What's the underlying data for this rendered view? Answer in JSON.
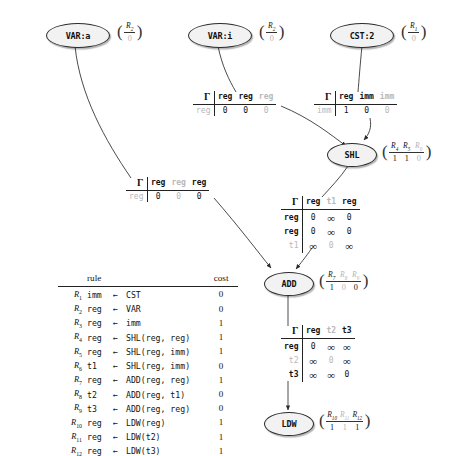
{
  "figure": {
    "type": "instruction-selection-dag",
    "nodes": [
      {
        "id": "var-a",
        "label": "VAR:a",
        "rvec": {
          "num": [
            "R2"
          ],
          "den": [
            "0"
          ],
          "dim": []
        }
      },
      {
        "id": "var-i",
        "label": "VAR:i",
        "rvec": {
          "num": [
            "R2"
          ],
          "den": [
            "0"
          ],
          "dim": []
        }
      },
      {
        "id": "cst-2",
        "label": "CST:2",
        "rvec": {
          "num": [
            "R1"
          ],
          "den": [
            "0"
          ],
          "dim": []
        }
      },
      {
        "id": "shl",
        "label": "SHL",
        "rvec": {
          "num": [
            "R4",
            "R5",
            "R6"
          ],
          "den": [
            "1",
            "1",
            "0"
          ],
          "dim": [
            2
          ]
        }
      },
      {
        "id": "add",
        "label": "ADD",
        "rvec": {
          "num": [
            "R7",
            "R8",
            "R9"
          ],
          "den": [
            "1",
            "0",
            "0"
          ],
          "dim": [
            1,
            2
          ]
        }
      },
      {
        "id": "ldw",
        "label": "LDW",
        "rvec": {
          "num": [
            "R10",
            "R11",
            "R12"
          ],
          "den": [
            "1",
            "1",
            "1"
          ],
          "dim": [
            1
          ]
        }
      }
    ],
    "tables": [
      {
        "id": "gamma-var-i",
        "corner": "Γ",
        "columns": [
          {
            "label": "reg",
            "dim": false
          },
          {
            "label": "reg",
            "dim": false
          },
          {
            "label": "reg",
            "dim": true
          }
        ],
        "rows": [
          {
            "label": "reg",
            "dim": true,
            "cells": [
              {
                "v": "0",
                "dim": false
              },
              {
                "v": "0",
                "dim": false
              },
              {
                "v": "0",
                "dim": true
              }
            ]
          }
        ]
      },
      {
        "id": "gamma-cst-2",
        "corner": "Γ",
        "columns": [
          {
            "label": "reg",
            "dim": false
          },
          {
            "label": "imm",
            "dim": false
          },
          {
            "label": "imm",
            "dim": true
          }
        ],
        "rows": [
          {
            "label": "imm",
            "dim": true,
            "cells": [
              {
                "v": "1",
                "dim": false
              },
              {
                "v": "0",
                "dim": false
              },
              {
                "v": "0",
                "dim": true
              }
            ]
          }
        ]
      },
      {
        "id": "gamma-var-a",
        "corner": "Γ",
        "columns": [
          {
            "label": "reg",
            "dim": false
          },
          {
            "label": "reg",
            "dim": true
          },
          {
            "label": "reg",
            "dim": false
          }
        ],
        "rows": [
          {
            "label": "reg",
            "dim": true,
            "cells": [
              {
                "v": "0",
                "dim": false
              },
              {
                "v": "0",
                "dim": true
              },
              {
                "v": "0",
                "dim": false
              }
            ]
          }
        ]
      },
      {
        "id": "gamma-shl",
        "corner": "Γ",
        "columns": [
          {
            "label": "reg",
            "dim": false
          },
          {
            "label": "t1",
            "dim": true
          },
          {
            "label": "reg",
            "dim": false
          }
        ],
        "rows": [
          {
            "label": "reg",
            "dim": false,
            "cells": [
              {
                "v": "0",
                "dim": false
              },
              {
                "v": "∞",
                "dim": false
              },
              {
                "v": "0",
                "dim": false
              }
            ]
          },
          {
            "label": "reg",
            "dim": false,
            "cells": [
              {
                "v": "0",
                "dim": false
              },
              {
                "v": "∞",
                "dim": false
              },
              {
                "v": "0",
                "dim": false
              }
            ]
          },
          {
            "label": "t1",
            "dim": true,
            "cells": [
              {
                "v": "∞",
                "dim": false
              },
              {
                "v": "0",
                "dim": true
              },
              {
                "v": "∞",
                "dim": false
              }
            ]
          }
        ]
      },
      {
        "id": "gamma-add",
        "corner": "Γ",
        "columns": [
          {
            "label": "reg",
            "dim": false
          },
          {
            "label": "t2",
            "dim": true
          },
          {
            "label": "t3",
            "dim": false
          }
        ],
        "rows": [
          {
            "label": "reg",
            "dim": false,
            "cells": [
              {
                "v": "0",
                "dim": false
              },
              {
                "v": "∞",
                "dim": false
              },
              {
                "v": "∞",
                "dim": false
              }
            ]
          },
          {
            "label": "t2",
            "dim": true,
            "cells": [
              {
                "v": "∞",
                "dim": false
              },
              {
                "v": "0",
                "dim": true
              },
              {
                "v": "∞",
                "dim": false
              }
            ]
          },
          {
            "label": "t3",
            "dim": false,
            "cells": [
              {
                "v": "∞",
                "dim": false
              },
              {
                "v": "∞",
                "dim": false
              },
              {
                "v": "0",
                "dim": false
              }
            ]
          }
        ]
      }
    ],
    "rules_table": {
      "header": {
        "rule": "rule",
        "cost": "cost"
      },
      "rows": [
        {
          "label": "R1",
          "lhs": "imm",
          "arrow": "←",
          "rhs": "CST",
          "cost": "0"
        },
        {
          "label": "R2",
          "lhs": "reg",
          "arrow": "←",
          "rhs": "VAR",
          "cost": "0"
        },
        {
          "label": "R3",
          "lhs": "reg",
          "arrow": "←",
          "rhs": "imm",
          "cost": "1"
        },
        {
          "label": "R4",
          "lhs": "reg",
          "arrow": "←",
          "rhs": "SHL(reg, reg)",
          "cost": "1"
        },
        {
          "label": "R5",
          "lhs": "reg",
          "arrow": "←",
          "rhs": "SHL(reg, imm)",
          "cost": "1"
        },
        {
          "label": "R6",
          "lhs": "t1",
          "arrow": "←",
          "rhs": "SHL(reg, imm)",
          "cost": "0"
        },
        {
          "label": "R7",
          "lhs": "reg",
          "arrow": "←",
          "rhs": "ADD(reg, reg)",
          "cost": "1"
        },
        {
          "label": "R8",
          "lhs": "t2",
          "arrow": "←",
          "rhs": "ADD(reg, t1)",
          "cost": "0"
        },
        {
          "label": "R9",
          "lhs": "t3",
          "arrow": "←",
          "rhs": "ADD(reg, reg)",
          "cost": "0"
        },
        {
          "label": "R10",
          "lhs": "reg",
          "arrow": "←",
          "rhs": "LDW(reg)",
          "cost": "1"
        },
        {
          "label": "R11",
          "lhs": "reg",
          "arrow": "←",
          "rhs": "LDW(t2)",
          "cost": "1"
        },
        {
          "label": "R12",
          "lhs": "reg",
          "arrow": "←",
          "rhs": "LDW(t3)",
          "cost": "1"
        }
      ]
    }
  },
  "colors": {
    "ink": "#111111",
    "dim": "#b8b8b8",
    "node_fill": "#f2f2f2",
    "node_stroke": "#2b2b2b",
    "background": "#ffffff"
  }
}
